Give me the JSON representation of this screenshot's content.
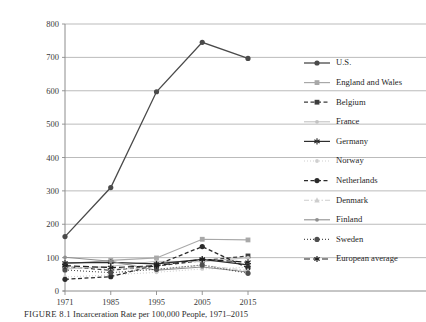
{
  "figure": {
    "caption_prefix": "FIGURE 8.1",
    "caption_text": "Incarceration Rate per 100,000 People, 1971–2015"
  },
  "chart_data": {
    "type": "line",
    "title": "",
    "xlabel": "",
    "ylabel": "",
    "ylim": [
      0,
      800
    ],
    "ytick_values": [
      0,
      100,
      200,
      300,
      400,
      500,
      600,
      700,
      800
    ],
    "ytick_labels": [
      "0",
      "100",
      "200",
      "300",
      "400",
      "500",
      "600",
      "700",
      "800"
    ],
    "grid": true,
    "legend_position": "right",
    "categories": [
      "1971",
      "1985",
      "1995",
      "2005",
      "2015"
    ],
    "x": [
      1971,
      1985,
      1995,
      2005,
      2015
    ],
    "series": [
      {
        "name": "U.S.",
        "color": "#4a4a4a",
        "marker": "circle",
        "dash": "none",
        "width": 1.3,
        "values": [
          163,
          310,
          597,
          745,
          697
        ]
      },
      {
        "name": "England and Wales",
        "color": "#a8a8a8",
        "marker": "square",
        "dash": "none",
        "width": 1.2,
        "values": [
          81,
          92,
          99,
          155,
          153
        ]
      },
      {
        "name": "Belgium",
        "color": "#3d3d3d",
        "marker": "square",
        "dash": "dash",
        "width": 1.2,
        "values": [
          73,
          62,
          75,
          91,
          105
        ]
      },
      {
        "name": "France",
        "color": "#c2c2c2",
        "marker": "circle-small",
        "dash": "none",
        "width": 1.1,
        "values": [
          66,
          74,
          89,
          88,
          100
        ]
      },
      {
        "name": "Germany",
        "color": "#2e2e2e",
        "marker": "asterisk",
        "dash": "none",
        "width": 1.2,
        "values": [
          84,
          86,
          81,
          95,
          78
        ]
      },
      {
        "name": "Norway",
        "color": "#cfcfcf",
        "marker": "circle-small",
        "dash": "dot",
        "width": 1.1,
        "values": [
          42,
          48,
          56,
          66,
          71
        ]
      },
      {
        "name": "Netherlands",
        "color": "#2b2b2b",
        "marker": "circle",
        "dash": "dash",
        "width": 1.3,
        "values": [
          35,
          43,
          78,
          133,
          69
        ]
      },
      {
        "name": "Denmark",
        "color": "#cdcdcd",
        "marker": "triangle",
        "dash": "dashdot",
        "width": 1.1,
        "values": [
          72,
          68,
          64,
          77,
          61
        ]
      },
      {
        "name": "Finland",
        "color": "#8f8f8f",
        "marker": "circle-small",
        "dash": "none",
        "width": 1.1,
        "values": [
          101,
          89,
          62,
          72,
          57
        ]
      },
      {
        "name": "Sweden",
        "color": "#4d4d4d",
        "marker": "circle",
        "dash": "dot",
        "width": 1.1,
        "values": [
          63,
          55,
          65,
          78,
          53
        ]
      },
      {
        "name": "European average",
        "color": "#1f1f1f",
        "marker": "asterisk",
        "dash": "longdash",
        "width": 1.2,
        "values": [
          76,
          70,
          76,
          95,
          86
        ]
      }
    ]
  },
  "axes": {
    "plot_left": 65,
    "plot_right": 248,
    "plot_top": 24,
    "plot_bottom": 291
  }
}
